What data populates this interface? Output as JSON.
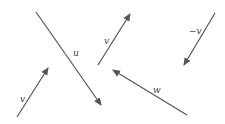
{
  "diagram": {
    "title": "",
    "stroke_color": "#555555",
    "label_color": "#444444",
    "vectors": [
      {
        "id": "v-bottom-left",
        "label": "v",
        "tail": [
          17,
          117
        ],
        "head": [
          48,
          68
        ],
        "label_pos": [
          20,
          102
        ]
      },
      {
        "id": "u",
        "label": "u",
        "tail": [
          36,
          12
        ],
        "head": [
          101,
          105
        ],
        "label_pos": [
          73,
          56
        ]
      },
      {
        "id": "v-top-middle",
        "label": "v",
        "tail": [
          98,
          65
        ],
        "head": [
          130,
          14
        ],
        "label_pos": [
          104,
          44
        ]
      },
      {
        "id": "neg-v",
        "label": "−v",
        "tail": [
          215,
          13
        ],
        "head": [
          184,
          65
        ],
        "label_pos": [
          189,
          34
        ]
      },
      {
        "id": "w",
        "label": "w",
        "tail": [
          187,
          115
        ],
        "head": [
          113,
          70
        ],
        "label_pos": [
          153,
          93
        ]
      }
    ]
  }
}
